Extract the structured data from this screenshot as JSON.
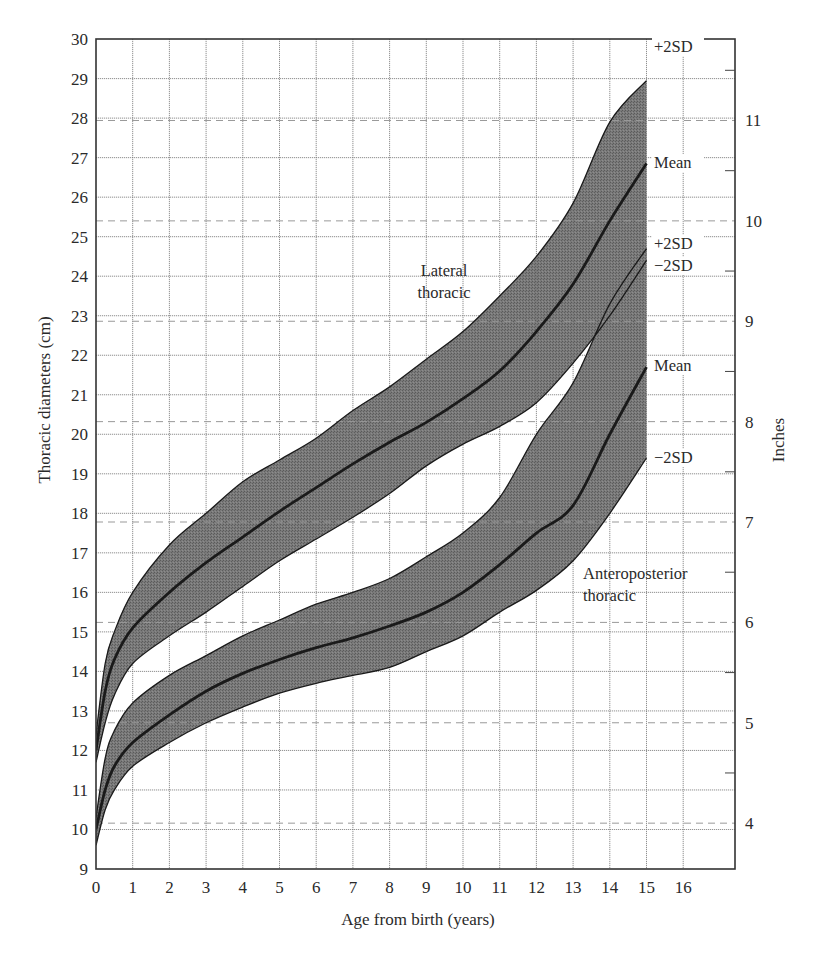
{
  "chart_data": {
    "type": "area",
    "title": "",
    "xlabel": "Age from birth (years)",
    "ylabel": "Thoracic diameters (cm)",
    "y2label": "Inches",
    "xlim": [
      0,
      17.4
    ],
    "ylim": [
      9,
      30
    ],
    "x_ticks": [
      0,
      1,
      2,
      3,
      4,
      5,
      6,
      7,
      8,
      9,
      10,
      11,
      12,
      13,
      14,
      15,
      16
    ],
    "y_ticks": [
      9,
      10,
      11,
      12,
      13,
      14,
      15,
      16,
      17,
      18,
      19,
      20,
      21,
      22,
      23,
      24,
      25,
      26,
      27,
      28,
      29,
      30
    ],
    "y2_ticks_inches": [
      4,
      5,
      6,
      7,
      8,
      9,
      10,
      11
    ],
    "grid": true,
    "x": [
      0,
      0.25,
      0.5,
      1,
      2,
      3,
      4,
      5,
      6,
      7,
      8,
      9,
      10,
      11,
      12,
      13,
      14,
      15
    ],
    "bands": [
      {
        "name": "Lateral thoracic",
        "label_lines": [
          "Lateral",
          "thoracic"
        ],
        "series": [
          {
            "name": "+2SD",
            "values": [
              12.4,
              14.2,
              15.0,
              16.0,
              17.2,
              18.0,
              18.8,
              19.35,
              19.9,
              20.6,
              21.2,
              21.9,
              22.6,
              23.5,
              24.5,
              25.85,
              27.9,
              28.95
            ]
          },
          {
            "name": "Mean",
            "values": [
              12.0,
              13.5,
              14.3,
              15.1,
              16.0,
              16.75,
              17.4,
              18.05,
              18.65,
              19.25,
              19.8,
              20.3,
              20.9,
              21.6,
              22.6,
              23.8,
              25.4,
              26.85
            ]
          },
          {
            "name": "-2SD",
            "values": [
              11.7,
              12.7,
              13.4,
              14.2,
              14.9,
              15.5,
              16.15,
              16.8,
              17.35,
              17.9,
              18.5,
              19.2,
              19.75,
              20.2,
              20.8,
              21.8,
              23.0,
              24.4
            ]
          }
        ]
      },
      {
        "name": "Anteroposterior thoracic",
        "label_lines": [
          "Anteroposterior",
          "thoracic"
        ],
        "series": [
          {
            "name": "+2SD",
            "values": [
              10.3,
              11.8,
              12.5,
              13.2,
              13.9,
              14.4,
              14.9,
              15.3,
              15.7,
              16.0,
              16.35,
              16.9,
              17.5,
              18.4,
              20.0,
              21.3,
              23.3,
              24.7
            ]
          },
          {
            "name": "Mean",
            "values": [
              10.0,
              11.0,
              11.6,
              12.2,
              12.9,
              13.5,
              13.95,
              14.3,
              14.6,
              14.85,
              15.15,
              15.5,
              16.0,
              16.7,
              17.5,
              18.2,
              20.0,
              21.7
            ]
          },
          {
            "name": "-2SD",
            "values": [
              9.6,
              10.5,
              11.0,
              11.6,
              12.2,
              12.7,
              13.1,
              13.45,
              13.7,
              13.9,
              14.1,
              14.5,
              14.9,
              15.5,
              16.05,
              16.8,
              18.0,
              19.4
            ]
          }
        ]
      }
    ],
    "annotations": [
      {
        "text": "+2SD",
        "x_px": 654,
        "y_px": 52
      },
      {
        "text": "Mean",
        "x_px": 654,
        "y_px": 168
      },
      {
        "text": "+2SD",
        "x_px": 654,
        "y_px": 249
      },
      {
        "text": "−2SD",
        "x_px": 654,
        "y_px": 271
      },
      {
        "text": "Mean",
        "x_px": 654,
        "y_px": 371
      },
      {
        "text": "−2SD",
        "x_px": 654,
        "y_px": 463
      }
    ],
    "colors": {
      "band_fill": "#6f6f6f",
      "curve": "#1a1a1a",
      "grid": "#8a8a8a",
      "frame": "#333333",
      "text": "#2a2a2a"
    }
  }
}
